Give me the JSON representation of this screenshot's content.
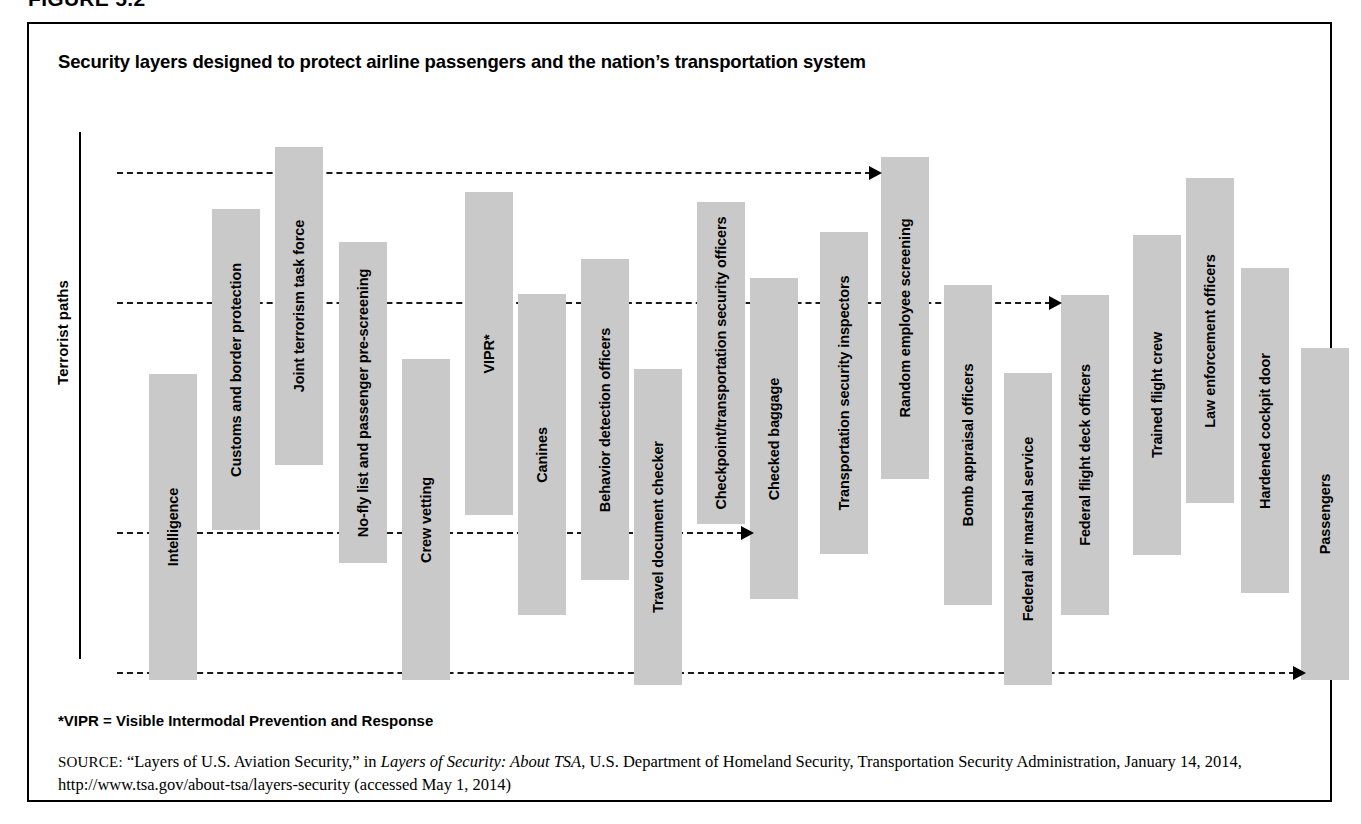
{
  "figure": {
    "number": "FIGURE 5.2",
    "title": "Security layers designed to protect airline passengers and the nation’s transportation system",
    "axis_label": "Terrorist paths",
    "footnote": "*VIPR = Visible Intermodal Prevention and Response",
    "source_keyword": "SOURCE:",
    "source_part1": " “Layers of U.S. Aviation Security,” in ",
    "source_italic1": "Layers of Security: About TSA",
    "source_part2": ", U.S. Department of Homeland Security, Transportation Security Administration, January 14, 2014, http://www.tsa.gov/about-tsa/layers-security (accessed May 1, 2014)"
  },
  "colors": {
    "bar_fill": "#c9c9c9",
    "frame": "#000000",
    "path": "#1a1a1a",
    "background": "#ffffff"
  },
  "chart_data": {
    "type": "bar",
    "title": "Security layers designed to protect airline passengers and the nation’s transportation system",
    "xlabel": "",
    "ylabel": "Terrorist paths",
    "grid": false,
    "legend": "none",
    "note": "Floating (range) bars: each security layer spans a vertical interval; four horizontal dashed arrows depict terrorist paths penetrating between layers.",
    "categories": [
      "Intelligence",
      "Customs and border protection",
      "Joint terrorism task force",
      "No-fly list and passenger pre-screening",
      "Crew vetting",
      "VIPR*",
      "Canines",
      "Behavior detection officers",
      "Travel document checker",
      "Checkpoint/transportation security officers",
      "Checked baggage",
      "Transportation security inspectors",
      "Random employee screening",
      "Bomb appraisal officers",
      "Federal air marshal service",
      "Federal flight deck officers",
      "Trained flight crew",
      "Law enforcement officers",
      "Hardened cockpit door",
      "Passengers"
    ],
    "bars": [
      {
        "label": "Intelligence",
        "x": 120,
        "top": 350,
        "bottom": 656,
        "width": 48
      },
      {
        "label": "Customs and border protection",
        "x": 183,
        "top": 185,
        "bottom": 506,
        "width": 48
      },
      {
        "label": "Joint terrorism task force",
        "x": 246,
        "top": 123,
        "bottom": 441,
        "width": 48
      },
      {
        "label": "No-fly list and passenger pre-screening",
        "x": 310,
        "top": 218,
        "bottom": 539,
        "width": 48
      },
      {
        "label": "Crew vetting",
        "x": 373,
        "top": 335,
        "bottom": 656,
        "width": 48
      },
      {
        "label": "VIPR*",
        "x": 436,
        "top": 168,
        "bottom": 491,
        "width": 48
      },
      {
        "label": "Canines",
        "x": 489,
        "top": 270,
        "bottom": 591,
        "width": 48
      },
      {
        "label": "Behavior detection officers",
        "x": 552,
        "top": 235,
        "bottom": 556,
        "width": 48
      },
      {
        "label": "Travel document checker",
        "x": 605,
        "top": 345,
        "bottom": 661,
        "width": 48
      },
      {
        "label": "Checkpoint/transportation security officers",
        "x": 668,
        "top": 178,
        "bottom": 500,
        "width": 48
      },
      {
        "label": "Checked baggage",
        "x": 721,
        "top": 254,
        "bottom": 575,
        "width": 48
      },
      {
        "label": "Transportation security inspectors",
        "x": 791,
        "top": 208,
        "bottom": 530,
        "width": 48
      },
      {
        "label": "Random employee screening",
        "x": 852,
        "top": 133,
        "bottom": 455,
        "width": 48
      },
      {
        "label": "Bomb appraisal officers",
        "x": 915,
        "top": 261,
        "bottom": 581,
        "width": 48
      },
      {
        "label": "Federal air marshal service",
        "x": 975,
        "top": 349,
        "bottom": 661,
        "width": 48
      },
      {
        "label": "Federal flight deck officers",
        "x": 1032,
        "top": 271,
        "bottom": 591,
        "width": 48
      },
      {
        "label": "Trained flight crew",
        "x": 1104,
        "top": 211,
        "bottom": 531,
        "width": 48
      },
      {
        "label": "Law enforcement officers",
        "x": 1157,
        "top": 154,
        "bottom": 479,
        "width": 48
      },
      {
        "label": "Hardened cockpit door",
        "x": 1212,
        "top": 244,
        "bottom": 569,
        "width": 48
      },
      {
        "label": "Passengers",
        "x": 1272,
        "top": 324,
        "bottom": 656,
        "width": 48
      }
    ],
    "terrorist_paths": [
      {
        "id": "path-1",
        "y": 148,
        "x_start": 88,
        "x_end": 852,
        "arrow": true
      },
      {
        "id": "path-2",
        "y": 278,
        "x_start": 88,
        "x_end": 1032,
        "arrow": true
      },
      {
        "id": "path-3",
        "y": 508,
        "x_start": 88,
        "x_end": 724,
        "arrow": true
      },
      {
        "id": "path-4",
        "y": 648,
        "x_start": 88,
        "x_end": 1276,
        "arrow": true
      }
    ]
  }
}
